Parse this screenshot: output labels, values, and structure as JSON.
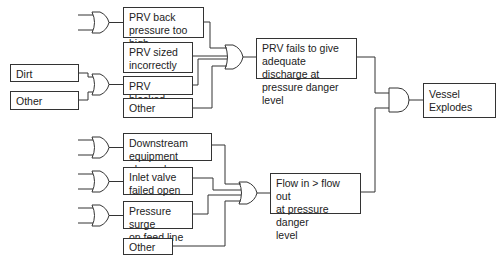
{
  "diagram": {
    "type": "fault-tree",
    "top_event": "Vessel\nExplodes",
    "branches": {
      "prv_fails": {
        "label": "PRV fails to give\nadequate discharge at\npressure danger level",
        "causes": [
          {
            "id": "prv_back",
            "label": "PRV back\npressure too high"
          },
          {
            "id": "prv_sized",
            "label": "PRV sized\nincorrectly"
          },
          {
            "id": "prv_blocked",
            "label": "PRV blocked"
          },
          {
            "id": "other_top",
            "label": "Other"
          }
        ],
        "blocked_causes": [
          {
            "id": "dirt",
            "label": "Dirt"
          },
          {
            "id": "other_left",
            "label": "Other"
          }
        ]
      },
      "flow": {
        "label": "Flow in > flow out\nat pressure danger\nlevel",
        "causes": [
          {
            "id": "downstream",
            "label": "Downstream\nequipment plugged"
          },
          {
            "id": "inlet",
            "label": "Inlet valve\nfailed open"
          },
          {
            "id": "surge",
            "label": "Pressure surge\non feed line"
          },
          {
            "id": "other_bottom",
            "label": "Other"
          }
        ]
      }
    },
    "gates": {
      "top_and": "AND",
      "prv_or": "OR",
      "flow_or": "OR",
      "blocked_or": "OR",
      "back_or": "OR",
      "downstream_or": "OR",
      "inlet_or": "OR",
      "surge_or": "OR"
    },
    "colors": {
      "line": "#333333",
      "background": "#ffffff",
      "text": "#222222"
    }
  }
}
